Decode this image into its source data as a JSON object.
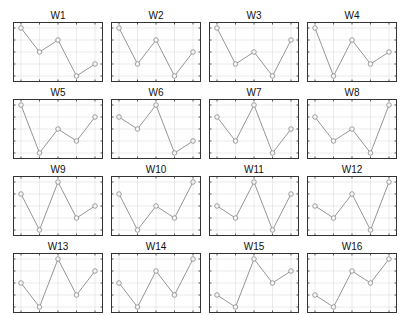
{
  "chart_data": {
    "type": "line",
    "layout": {
      "rows": 4,
      "cols": 4,
      "grid": true,
      "legend": "none"
    },
    "x": [
      1,
      2,
      3,
      4,
      5
    ],
    "ylim": [
      1,
      5
    ],
    "marker": "circle",
    "colors": {
      "line": "#8a8a8a",
      "marker": "#8a8a8a",
      "frame": "#333333",
      "grid": "#dddddd"
    },
    "panels": [
      {
        "title": "W1",
        "values": [
          5,
          3,
          4,
          1,
          2
        ]
      },
      {
        "title": "W2",
        "values": [
          5,
          2,
          4,
          1,
          3
        ]
      },
      {
        "title": "W3",
        "values": [
          5,
          2,
          3,
          1,
          4
        ]
      },
      {
        "title": "W4",
        "values": [
          5,
          1,
          4,
          2,
          3
        ]
      },
      {
        "title": "W5",
        "values": [
          5,
          1,
          3,
          2,
          4
        ]
      },
      {
        "title": "W6",
        "values": [
          4,
          3,
          5,
          1,
          2
        ]
      },
      {
        "title": "W7",
        "values": [
          4,
          2,
          5,
          1,
          3
        ]
      },
      {
        "title": "W8",
        "values": [
          4,
          2,
          3,
          1,
          5
        ]
      },
      {
        "title": "W9",
        "values": [
          4,
          1,
          5,
          2,
          3
        ]
      },
      {
        "title": "W10",
        "values": [
          4,
          1,
          3,
          2,
          5
        ]
      },
      {
        "title": "W11",
        "values": [
          3,
          2,
          5,
          1,
          4
        ]
      },
      {
        "title": "W12",
        "values": [
          3,
          2,
          4,
          1,
          5
        ]
      },
      {
        "title": "W13",
        "values": [
          3,
          1,
          5,
          2,
          4
        ]
      },
      {
        "title": "W14",
        "values": [
          3,
          1,
          4,
          2,
          5
        ]
      },
      {
        "title": "W15",
        "values": [
          2,
          1,
          5,
          3,
          4
        ]
      },
      {
        "title": "W16",
        "values": [
          2,
          1,
          4,
          3,
          5
        ]
      }
    ]
  }
}
